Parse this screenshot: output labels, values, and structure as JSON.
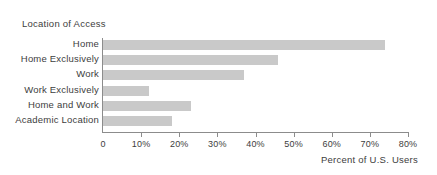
{
  "chart_data": {
    "type": "bar",
    "orientation": "horizontal",
    "title": "Location of Access",
    "xlabel": "Percent of U.S. Users",
    "ylabel": "",
    "categories": [
      "Home",
      "Home Exclusively",
      "Work",
      "Work Exclusively",
      "Home and Work",
      "Academic Location"
    ],
    "values": [
      74,
      46,
      37,
      12,
      23,
      18
    ],
    "xlim": [
      0,
      80
    ],
    "xticks": [
      0,
      10,
      20,
      30,
      40,
      50,
      60,
      70,
      80
    ],
    "xtick_labels": [
      "0",
      "10%",
      "20%",
      "30%",
      "40%",
      "50%",
      "60%",
      "70%",
      "80%"
    ],
    "grid": false,
    "legend": null,
    "bar_color": "#c9c9c9",
    "axis_color": "#8c8c8c",
    "text_color": "#3d3d3d",
    "background": "#ffffff"
  }
}
